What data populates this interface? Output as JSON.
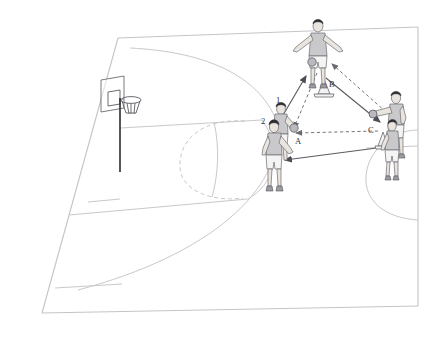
{
  "diagram": {
    "type": "half-court perspective drill diagram",
    "background_color": "#ffffff",
    "court_line_color": "#c9c9cc",
    "arrow_solid_color": "#5b5b62",
    "arrow_dashed_color": "#76767d"
  },
  "labels": [
    {
      "id": "label-1",
      "text": "1",
      "x": 276,
      "y": 99
    },
    {
      "id": "label-2",
      "text": "2",
      "x": 263,
      "y": 120
    },
    {
      "id": "label-A",
      "text": "A",
      "x": 296,
      "y": 141
    },
    {
      "id": "label-B",
      "text": "B",
      "x": 330,
      "y": 84
    },
    {
      "id": "label-C",
      "text": "C",
      "x": 369,
      "y": 130
    }
  ],
  "positions": {
    "player_1": {
      "label": "1",
      "role": "passer-front",
      "x": 277,
      "y": 120
    },
    "player_2": {
      "label": "2",
      "role": "queue-back",
      "x": 272,
      "y": 140
    },
    "player_A": {
      "label": "A",
      "role": "receiver-left",
      "x": 292,
      "y": 132
    },
    "player_B": {
      "label": "B",
      "role": "top-defender",
      "x": 318,
      "y": 45
    },
    "player_C": {
      "label": "C",
      "role": "right-wing",
      "x": 393,
      "y": 110
    },
    "player_C2": {
      "label": "C",
      "role": "right-wing-second",
      "x": 390,
      "y": 140
    }
  },
  "cones": [
    {
      "id": "cone-B",
      "near_label": "B",
      "x": 324,
      "y": 86
    },
    {
      "id": "cone-C",
      "near_label": "C",
      "x": 383,
      "y": 137
    }
  ],
  "arrows": [
    {
      "id": "arrow-1-to-B",
      "style": "solid",
      "from": "1",
      "to": "B",
      "direction": "up-right",
      "meaning": "player movement"
    },
    {
      "id": "arrow-B-to-A",
      "style": "dashed",
      "from": "B",
      "to": "A",
      "direction": "down-left",
      "meaning": "pass"
    },
    {
      "id": "arrow-B-to-C",
      "style": "solid",
      "from": "B",
      "to": "C",
      "direction": "down-right",
      "meaning": "player movement"
    },
    {
      "id": "arrow-C-to-B",
      "style": "dashed",
      "from": "C",
      "to": "B",
      "direction": "up-left",
      "meaning": "pass"
    },
    {
      "id": "arrow-C-to-A",
      "style": "dashed",
      "from": "C",
      "to": "A",
      "direction": "left",
      "meaning": "pass"
    },
    {
      "id": "arrow-C2-to-2",
      "style": "solid",
      "from": "C",
      "to": "2",
      "direction": "left",
      "meaning": "player movement"
    }
  ],
  "court_features": {
    "hoop": "basketball-hoop-left",
    "backboard": "backboard-left",
    "pole": "hoop-support-pole",
    "three_point_arc": true,
    "free_throw_circle": "half-dashed",
    "key_lane": true,
    "baseline": true,
    "sideline_right": true,
    "second_court_arc_right": true
  }
}
